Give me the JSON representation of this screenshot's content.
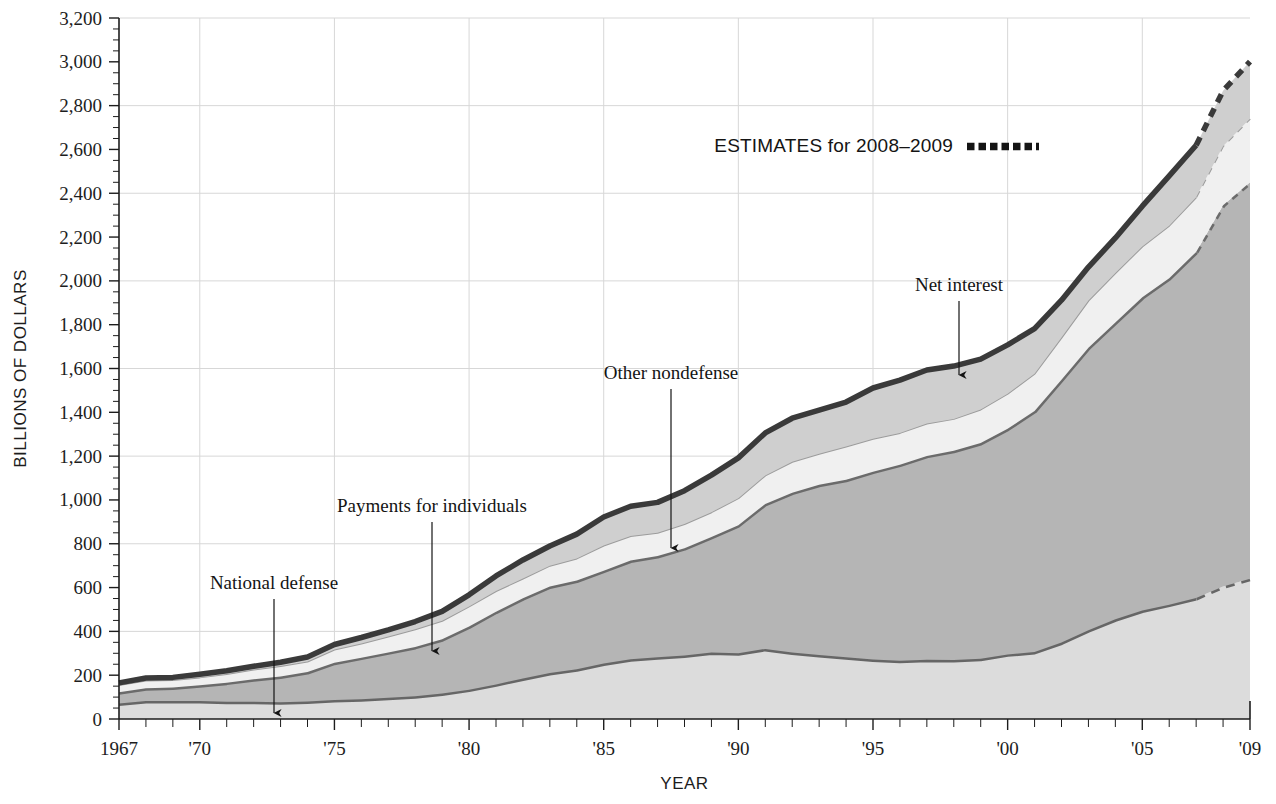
{
  "chart_data": {
    "type": "area",
    "stacked": true,
    "title": "",
    "xlabel": "YEAR",
    "ylabel": "BILLIONS OF DOLLARS",
    "xlim": [
      1967,
      2009
    ],
    "ylim": [
      0,
      3200
    ],
    "grid": true,
    "y_major_step": 400,
    "y_tick_step": 200,
    "y_minor_step": 50,
    "x_tick_step": 1,
    "x_gridline_step": 5,
    "legend_position": "inside-top-right",
    "x": [
      1967,
      1968,
      1969,
      1970,
      1971,
      1972,
      1973,
      1974,
      1975,
      1976,
      1977,
      1978,
      1979,
      1980,
      1981,
      1982,
      1983,
      1984,
      1985,
      1986,
      1987,
      1988,
      1989,
      1990,
      1991,
      1992,
      1993,
      1994,
      1995,
      1996,
      1997,
      1998,
      1999,
      2000,
      2001,
      2002,
      2003,
      2004,
      2005,
      2006,
      2007,
      2008,
      2009
    ],
    "xtick_labels": [
      "1967",
      "'70",
      "'75",
      "'80",
      "'85",
      "'90",
      "'95",
      "'00",
      "'05",
      "'09"
    ],
    "xtick_values": [
      1967,
      1970,
      1975,
      1980,
      1985,
      1990,
      1995,
      2000,
      2005,
      2009
    ],
    "ytick_labels": [
      "0",
      "200",
      "400",
      "600",
      "800",
      "1,000",
      "1,200",
      "1,400",
      "1,600",
      "1,800",
      "2,000",
      "2,200",
      "2,400",
      "2,600",
      "2,800",
      "3,000",
      "3,200"
    ],
    "ytick_values": [
      0,
      200,
      400,
      600,
      800,
      1000,
      1200,
      1400,
      1600,
      1800,
      2000,
      2200,
      2400,
      2600,
      2800,
      3000,
      3200
    ],
    "estimate_start_year": 2007,
    "series": [
      {
        "name": "National defense",
        "fill": "#dcdcdc",
        "edge": "#666666",
        "values": [
          71,
          82,
          82,
          82,
          79,
          79,
          77,
          80,
          87,
          90,
          97,
          104,
          116,
          134,
          158,
          185,
          210,
          227,
          253,
          273,
          282,
          290,
          304,
          300,
          320,
          303,
          292,
          282,
          272,
          266,
          271,
          269,
          275,
          295,
          306,
          349,
          405,
          455,
          495,
          522,
          552,
          605,
          640
        ]
      },
      {
        "name": "Payments for individuals",
        "fill": "#b5b5b5",
        "edge": "#6b6b6b",
        "values": [
          51,
          58,
          62,
          72,
          87,
          102,
          117,
          134,
          170,
          190,
          207,
          225,
          248,
          288,
          332,
          366,
          395,
          405,
          424,
          450,
          462,
          490,
          527,
          585,
          662,
          730,
          777,
          810,
          857,
          895,
          930,
          955,
          985,
          1030,
          1100,
          1200,
          1290,
          1355,
          1430,
          1490,
          1580,
          1740,
          1810
        ]
      },
      {
        "name": "Other nondefense",
        "fill": "#f0f0f0",
        "edge": "#9c9c9c",
        "values": [
          33,
          36,
          34,
          36,
          39,
          45,
          48,
          48,
          60,
          65,
          73,
          81,
          84,
          92,
          94,
          90,
          95,
          101,
          115,
          112,
          106,
          110,
          113,
          123,
          130,
          141,
          142,
          152,
          150,
          145,
          148,
          146,
          153,
          160,
          170,
          192,
          215,
          226,
          232,
          240,
          250,
          270,
          290
        ]
      },
      {
        "name": "Net interest",
        "fill": "#cfcfcf",
        "edge": "#3a3a3a",
        "values": [
          10,
          11,
          12,
          14,
          15,
          15,
          17,
          21,
          23,
          27,
          30,
          35,
          43,
          53,
          69,
          85,
          90,
          111,
          130,
          136,
          139,
          152,
          169,
          184,
          194,
          199,
          199,
          203,
          232,
          241,
          244,
          241,
          230,
          223,
          206,
          171,
          153,
          160,
          184,
          227,
          237,
          253,
          261
        ]
      }
    ],
    "annotations": [
      {
        "name": "National defense",
        "label": "National defense",
        "label_x": 274,
        "label_y": 589,
        "arrow_x": 274,
        "arrow_y1": 599,
        "arrow_y2": 713
      },
      {
        "name": "Payments for individuals",
        "label": "Payments for individuals",
        "label_x": 432,
        "label_y": 512,
        "arrow_x": 432,
        "arrow_y1": 522,
        "arrow_y2": 651
      },
      {
        "name": "Other nondefense",
        "label": "Other nondefense",
        "label_x": 671,
        "label_y": 379,
        "arrow_x": 671,
        "arrow_y1": 389,
        "arrow_y2": 548
      },
      {
        "name": "Net interest",
        "label": "Net interest",
        "label_x": 959,
        "label_y": 291,
        "arrow_x": 959,
        "arrow_y1": 301,
        "arrow_y2": 375
      }
    ],
    "legend": {
      "text": "ESTIMATES for 2008–2009",
      "marker": "dotted-thick-line",
      "marker_color": "#141414"
    },
    "colors": {
      "national_defense": "#dcdcdc",
      "payments_for_individuals": "#b5b5b5",
      "other_nondefense": "#f0f0f0",
      "net_interest": "#cfcfcf",
      "top_outline": "#3a3a3a",
      "gridline": "#d7d7d7",
      "axis": "#1d1d1d"
    }
  }
}
